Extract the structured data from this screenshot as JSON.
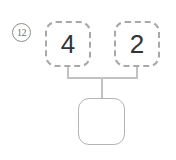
{
  "worksheet": {
    "problem_number": "12",
    "type": "number-bond",
    "parts": [
      {
        "value": "4",
        "filled": true
      },
      {
        "value": "2",
        "filled": true
      }
    ],
    "whole": {
      "value": "",
      "filled": false
    },
    "colors": {
      "part_border": "#a8a8a8",
      "whole_border": "#b4b4b4",
      "connector": "#c2c2c2",
      "digit": "#333333",
      "problem_number": "#6f6f6f",
      "background": "#ffffff"
    }
  }
}
